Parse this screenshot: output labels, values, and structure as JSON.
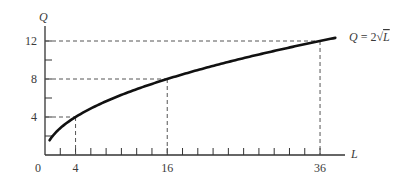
{
  "chart_data": {
    "type": "line",
    "title": "",
    "xlabel": "L",
    "ylabel": "Q",
    "function_label": "Q = 2√L",
    "function_label_parts": {
      "lhs": "Q",
      "eq": " = 2",
      "radical": "√",
      "arg": "L"
    },
    "xlim": [
      0,
      40
    ],
    "ylim": [
      0,
      13.5
    ],
    "x_tick_labels": [
      "0",
      "4",
      "16",
      "36"
    ],
    "x_tick_values": [
      0,
      4,
      16,
      36
    ],
    "x_minor_ticks_every": 2,
    "y_tick_labels": [
      "4",
      "8",
      "12"
    ],
    "y_tick_values": [
      4,
      8,
      12
    ],
    "y_minor_ticks_every": 2,
    "grid": false,
    "series": [
      {
        "name": "Q = 2√L",
        "function": "2*sqrt(L)",
        "x_range": [
          0.6,
          38
        ],
        "x": [
          0.6,
          1,
          4,
          9,
          16,
          25,
          36,
          38
        ],
        "values": [
          1.55,
          2,
          4,
          6,
          8,
          10,
          12,
          12.33
        ]
      }
    ],
    "reference_points": [
      {
        "L": 4,
        "Q": 4
      },
      {
        "L": 16,
        "Q": 8
      },
      {
        "L": 36,
        "Q": 12
      }
    ],
    "colors": {
      "curve": "#111111",
      "axis": "#333333",
      "dashed": "#555555",
      "text": "#3a3a3a"
    }
  }
}
